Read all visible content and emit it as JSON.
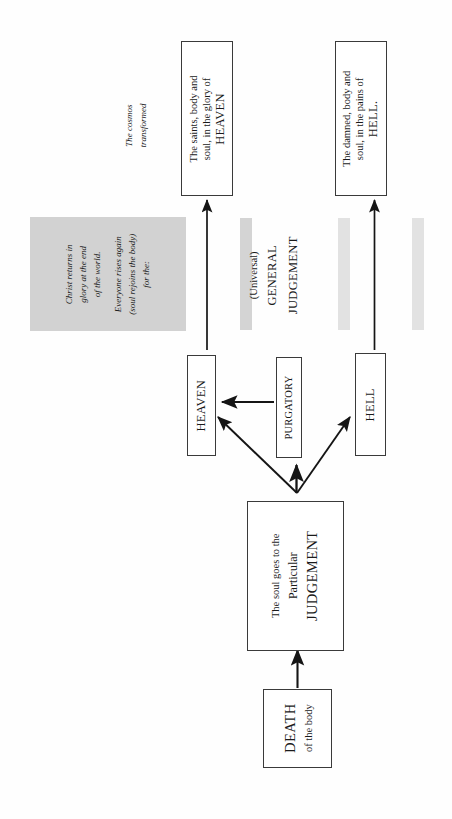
{
  "diagram": {
    "orientation": "rotated-90-ccw",
    "line_color": "#1a1a1a",
    "box_border_color": "#3a3a3a",
    "shade_color": "#d2d2d2",
    "shade_light_color": "#e2e2e2",
    "page_background": "#fefefe"
  },
  "nodes": {
    "death": {
      "line1": "DEATH",
      "line2": "of the body"
    },
    "particular_judgement": {
      "line1": "The soul goes to the",
      "line2": "Particular",
      "line3": "JUDGEMENT"
    },
    "heaven_small": {
      "label": "HEAVEN"
    },
    "purgatory_small": {
      "label": "PURGATORY"
    },
    "hell_small": {
      "label": "HELL"
    },
    "heaven_final": {
      "line1": "The saints, body and",
      "line2": "soul, in the glory of",
      "line3": "HEAVEN"
    },
    "hell_final": {
      "line1": "The damned, body and",
      "line2": "soul, in the pains of",
      "line3": "HELL."
    }
  },
  "annotations": {
    "cosmos": {
      "line1": "The cosmos",
      "line2": "transformed"
    },
    "christ_returns": {
      "line1": "Christ returns in",
      "line2": "glory at the end",
      "line3": "of the world."
    },
    "everyone_rises": {
      "line1": "Everyone rises again",
      "line2": "(soul rejoins the body)",
      "line3": "for the:"
    },
    "general_judgement": {
      "line1": "(Universal)",
      "line2": "GENERAL",
      "line3": "JUDGEMENT"
    }
  }
}
